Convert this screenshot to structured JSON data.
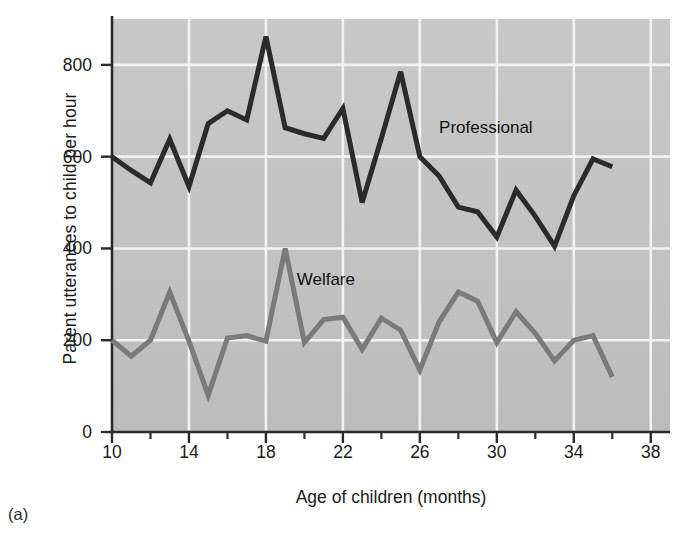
{
  "figure": {
    "panel_caption": "(a)",
    "background_color": "#ffffff",
    "plot_background_color": "#c2c2c2",
    "gridline_color": "#f2f2f2",
    "axis_color": "#2b2b2b"
  },
  "chart_data": {
    "type": "line",
    "title": "",
    "subtitle": "",
    "xlabel": "Age of children (months)",
    "ylabel": "Parent utterances to child per hour",
    "xlim": [
      10,
      39
    ],
    "ylim": [
      0,
      900
    ],
    "xticks": [
      10,
      14,
      18,
      22,
      26,
      30,
      34,
      38
    ],
    "xtick_labels": [
      "10",
      "14",
      "18",
      "22",
      "26",
      "30",
      "34",
      "38"
    ],
    "xminor_ticks": [
      12,
      16,
      20,
      24,
      28,
      32,
      36
    ],
    "yticks": [
      0,
      200,
      400,
      600,
      800
    ],
    "ytick_labels": [
      "0",
      "200",
      "400",
      "600",
      "800"
    ],
    "x_gridlines": [
      14,
      18,
      22,
      26,
      30,
      34,
      38
    ],
    "y_gridlines": [
      200,
      400,
      600,
      800
    ],
    "grid": true,
    "legend_position": "inline-annotations",
    "x": [
      10,
      11,
      12,
      13,
      14,
      15,
      16,
      17,
      18,
      19,
      20,
      21,
      22,
      23,
      24,
      25,
      26,
      27,
      28,
      29,
      30,
      31,
      32,
      33,
      34,
      35,
      36
    ],
    "series": [
      {
        "name": "Professional",
        "color": "#2b2b2b",
        "line_width": 5,
        "label_x": 27.0,
        "label_y": 660,
        "values": [
          600,
          570,
          543,
          638,
          535,
          672,
          700,
          680,
          862,
          663,
          650,
          640,
          705,
          500,
          640,
          785,
          600,
          558,
          490,
          480,
          425,
          527,
          470,
          405,
          515,
          595,
          578
        ]
      },
      {
        "name": "Welfare",
        "color": "#7a7a7a",
        "line_width": 5,
        "label_x": 19.6,
        "label_y": 330,
        "values": [
          200,
          165,
          200,
          305,
          198,
          80,
          205,
          210,
          198,
          400,
          195,
          245,
          250,
          180,
          248,
          222,
          135,
          240,
          305,
          285,
          195,
          262,
          215,
          155,
          200,
          210,
          120
        ]
      }
    ]
  }
}
